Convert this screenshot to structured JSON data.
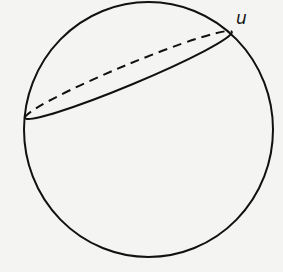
{
  "figure": {
    "type": "sphere-with-great-circle",
    "point_label": "u",
    "colors": {
      "stroke": "#111111",
      "background": "#f4f4f2"
    }
  }
}
